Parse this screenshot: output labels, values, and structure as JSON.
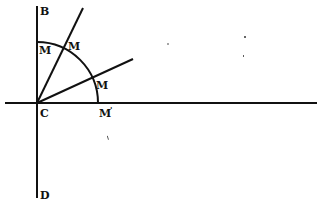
{
  "diagram": {
    "type": "geometry-figure",
    "colors": {
      "ink": "#111111",
      "background": "#ffffff"
    },
    "points": {
      "C": {
        "label": "C",
        "x": 37,
        "y": 103
      },
      "B": {
        "label": "B",
        "x": 37,
        "y": 6
      },
      "D": {
        "label": "D",
        "x": 37,
        "y": 197
      },
      "M_top": {
        "label": "M",
        "x": 37,
        "y": 42
      },
      "M_steep": {
        "label": "M",
        "x": 64,
        "y": 48
      },
      "M_shallow": {
        "label": "M",
        "x": 92,
        "y": 78
      },
      "M_axis": {
        "label": "M",
        "x": 98,
        "y": 103,
        "prime": "'"
      }
    },
    "lines": [
      {
        "name": "vertical-axis-BD",
        "from": [
          37,
          6
        ],
        "to": [
          37,
          198
        ]
      },
      {
        "name": "horizontal-axis",
        "from": [
          5,
          103
        ],
        "to": [
          317,
          103
        ]
      },
      {
        "name": "steep-ray",
        "from": [
          37,
          103
        ],
        "to": [
          83,
          8
        ]
      },
      {
        "name": "shallow-ray",
        "from": [
          37,
          103
        ],
        "to": [
          133,
          59
        ]
      }
    ],
    "arc": {
      "name": "quarter-circle",
      "center": [
        37,
        103
      ],
      "radius": 61
    },
    "labels": {
      "B": "B",
      "C": "C",
      "D": "D",
      "M1": "M",
      "M2": "M",
      "M3": "M",
      "M4": "M",
      "M4_prime": "'"
    }
  }
}
